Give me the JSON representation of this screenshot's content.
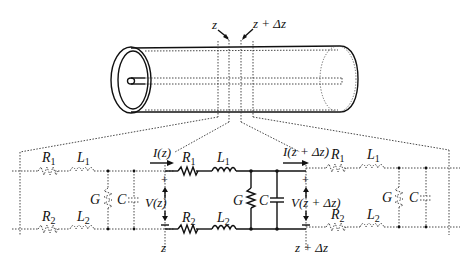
{
  "figure": {
    "type": "transmission-line-distributed-model"
  },
  "labels": {
    "z_top": "z",
    "z_dz_top": "z + Δz",
    "R1": "R",
    "R1_sub": "1",
    "L1": "L",
    "L1_sub": "1",
    "R2": "R",
    "R2_sub": "2",
    "L2": "L",
    "L2_sub": "2",
    "G": "G",
    "C": "C",
    "I_in": "I(z)",
    "I_out": "I(z + Δz)",
    "V_in": "V(z)",
    "V_out": "V(z + Δz)",
    "plus": "+",
    "minus": "−",
    "z_bottom": "z",
    "z_dz_bottom": "z + Δz"
  },
  "colors": {
    "line": "#111111",
    "dotted": "#555555",
    "background": "#ffffff"
  }
}
